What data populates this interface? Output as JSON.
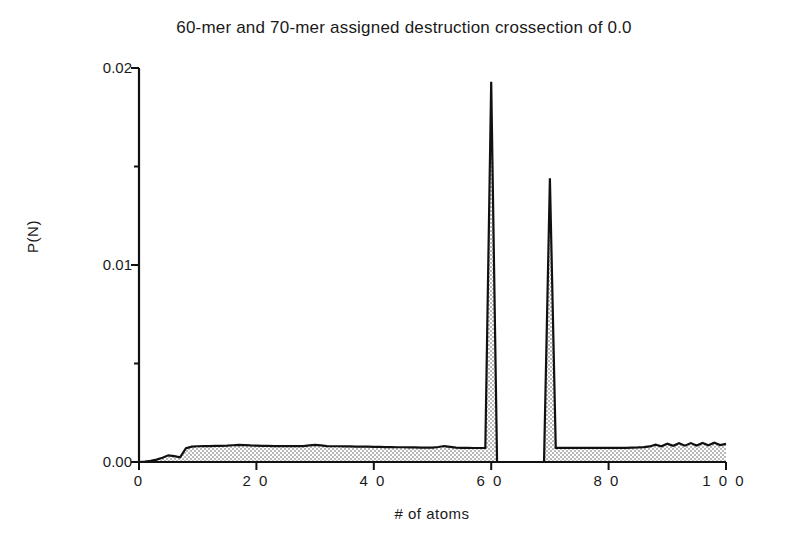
{
  "chart_data": {
    "type": "area",
    "title": "60-mer and 70-mer assigned destruction crossection of 0.0",
    "xlabel": "# of atoms",
    "ylabel": "P(N)",
    "xlim": [
      0,
      100
    ],
    "ylim": [
      0.0,
      0.02
    ],
    "grid": false,
    "legend": null,
    "fill_style": "stippled-gray",
    "xticks": [
      0,
      20,
      40,
      60,
      80,
      100
    ],
    "xtick_labels": [
      "0",
      "2 0",
      "4 0",
      "6 0",
      "8 0",
      "1 0 0"
    ],
    "yticks": [
      0.0,
      0.01,
      0.02
    ],
    "ytick_labels": [
      "0.00",
      "0.01",
      "0.02"
    ],
    "yminor_ticks": [
      0.005,
      0.015
    ],
    "annotations": [
      {
        "text": "peak at N=60",
        "x": 60,
        "y": 0.0193
      },
      {
        "text": "peak at N=70",
        "x": 70,
        "y": 0.0144
      }
    ],
    "x": [
      0,
      1,
      2,
      3,
      4,
      5,
      6,
      7,
      8,
      9,
      10,
      11,
      12,
      13,
      14,
      15,
      16,
      17,
      18,
      19,
      20,
      21,
      22,
      23,
      24,
      25,
      26,
      27,
      28,
      29,
      30,
      31,
      32,
      33,
      34,
      35,
      36,
      37,
      38,
      39,
      40,
      41,
      42,
      43,
      44,
      45,
      46,
      47,
      48,
      49,
      50,
      51,
      52,
      53,
      54,
      55,
      56,
      57,
      58,
      59,
      60,
      61,
      62,
      63,
      64,
      65,
      66,
      67,
      68,
      69,
      70,
      71,
      72,
      73,
      74,
      75,
      76,
      77,
      78,
      79,
      80,
      81,
      82,
      83,
      84,
      85,
      86,
      87,
      88,
      89,
      90,
      91,
      92,
      93,
      94,
      95,
      96,
      97,
      98,
      99,
      100
    ],
    "values": [
      0.0,
      2e-05,
      6e-05,
      0.00012,
      0.00022,
      0.00034,
      0.0003,
      0.00024,
      0.0007,
      0.00078,
      0.0008,
      0.00081,
      0.00081,
      0.00082,
      0.00082,
      0.00083,
      0.00085,
      0.00087,
      0.00086,
      0.00084,
      0.00083,
      0.00082,
      0.00082,
      0.00081,
      0.00081,
      0.00081,
      0.00081,
      0.00081,
      0.00081,
      0.00084,
      0.00087,
      0.00084,
      0.00081,
      0.0008,
      0.0008,
      0.00079,
      0.00079,
      0.00078,
      0.00078,
      0.00078,
      0.00077,
      0.00077,
      0.00076,
      0.00076,
      0.00075,
      0.00075,
      0.00074,
      0.00074,
      0.00073,
      0.00073,
      0.00073,
      0.00076,
      0.00081,
      0.00077,
      0.00073,
      0.00072,
      0.00072,
      0.00071,
      0.00071,
      0.00071,
      0.0193,
      0.0,
      0.0,
      0.0,
      0.0,
      0.0,
      0.0,
      0.0,
      0.0,
      0.0,
      0.0144,
      0.00072,
      0.00072,
      0.00072,
      0.00072,
      0.00072,
      0.00072,
      0.00072,
      0.00072,
      0.00072,
      0.00072,
      0.00072,
      0.00072,
      0.00072,
      0.00073,
      0.00074,
      0.00076,
      0.00079,
      0.00088,
      0.0008,
      0.00093,
      0.00082,
      0.00095,
      0.00083,
      0.00096,
      0.00084,
      0.00097,
      0.00085,
      0.00098,
      0.00086,
      0.00092
    ]
  },
  "axes": {
    "x_tick_0": "0",
    "x_tick_20": "2 0",
    "x_tick_40": "4 0",
    "x_tick_60": "6 0",
    "x_tick_80": "8 0",
    "x_tick_100": "1 0 0",
    "y_tick_000": "0.00",
    "y_tick_001": "0.01",
    "y_tick_002": "0.02"
  },
  "colors": {
    "axis": "#111111",
    "curve": "#111111",
    "fill": "#d8d8d8",
    "background": "#ffffff",
    "text": "#1a1a1a"
  }
}
